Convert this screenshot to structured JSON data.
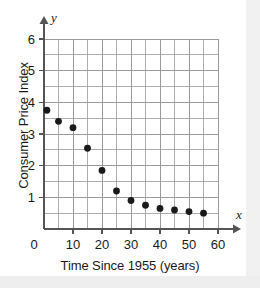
{
  "figure": {
    "background_color": "#ffffff",
    "grid_color": "#9a9a9a",
    "axis_color": "#555555",
    "point_color": "#1a1a1a",
    "text_color": "#1a1a1a"
  },
  "axis_symbols": {
    "x_symbol": "x",
    "y_symbol": "y"
  },
  "chart_data": {
    "type": "scatter",
    "title": "",
    "xlabel": "Time Since 1955 (years)",
    "ylabel": "Consumer Price Index",
    "xlim": [
      0,
      60
    ],
    "ylim": [
      0,
      6
    ],
    "xticks": [
      0,
      10,
      20,
      30,
      40,
      50,
      60
    ],
    "xtick_labels": [
      "0",
      "10",
      "20",
      "30",
      "40",
      "50",
      "60"
    ],
    "yticks": [
      1,
      2,
      3,
      4,
      5,
      6
    ],
    "ytick_labels": [
      "1",
      "2",
      "3",
      "4",
      "5",
      "6"
    ],
    "x_minor_step": 5,
    "y_minor_step": 0.5,
    "grid": true,
    "grid_minor": true,
    "legend": null,
    "x": [
      1,
      5,
      10,
      15,
      20,
      25,
      30,
      35,
      40,
      45,
      50,
      55
    ],
    "y": [
      3.75,
      3.4,
      3.2,
      2.55,
      1.85,
      1.2,
      0.9,
      0.75,
      0.65,
      0.6,
      0.55,
      0.5
    ],
    "points": [
      {
        "x": 1,
        "y": 3.75
      },
      {
        "x": 5,
        "y": 3.4
      },
      {
        "x": 10,
        "y": 3.2
      },
      {
        "x": 15,
        "y": 2.55
      },
      {
        "x": 20,
        "y": 1.85
      },
      {
        "x": 25,
        "y": 1.2
      },
      {
        "x": 30,
        "y": 0.9
      },
      {
        "x": 35,
        "y": 0.75
      },
      {
        "x": 40,
        "y": 0.65
      },
      {
        "x": 45,
        "y": 0.6
      },
      {
        "x": 50,
        "y": 0.55
      },
      {
        "x": 55,
        "y": 0.5
      }
    ]
  }
}
